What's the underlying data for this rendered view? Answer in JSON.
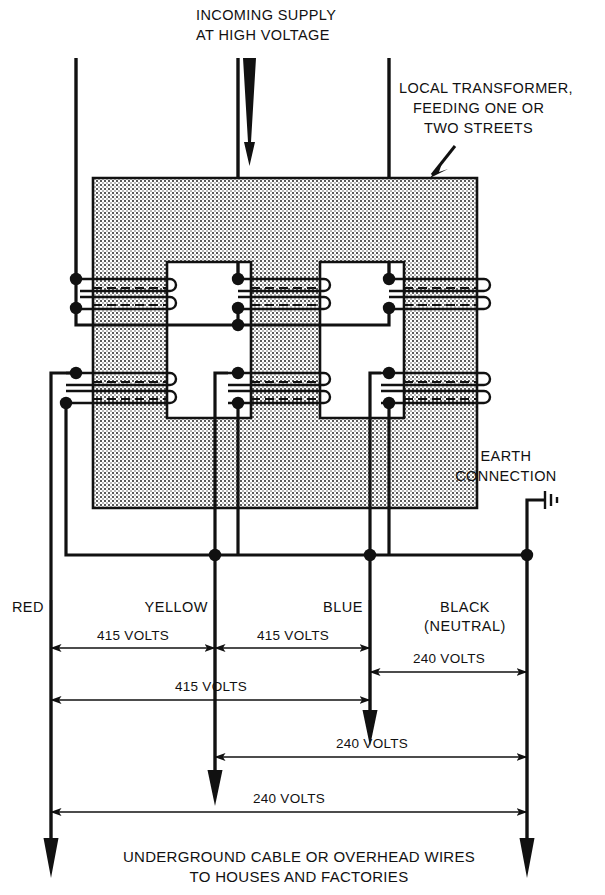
{
  "annotations": {
    "incoming_supply_line1": "INCOMING SUPPLY",
    "incoming_supply_line2": "AT HIGH VOLTAGE",
    "local_transformer_line1": "LOCAL TRANSFORMER,",
    "local_transformer_line2": "FEEDING ONE OR",
    "local_transformer_line3": "TWO STREETS",
    "earth_line1": "EARTH",
    "earth_line2": "CONNECTION",
    "caption_line1": "UNDERGROUND CABLE OR OVERHEAD WIRES",
    "caption_line2": "TO HOUSES AND FACTORIES"
  },
  "conductors": [
    {
      "id": "red",
      "label": "RED",
      "sublabel": "",
      "x": 51
    },
    {
      "id": "yellow",
      "label": "YELLOW",
      "sublabel": "",
      "x": 215
    },
    {
      "id": "blue",
      "label": "BLUE",
      "sublabel": "",
      "x": 370
    },
    {
      "id": "black",
      "label": "BLACK",
      "sublabel": "(NEUTRAL)",
      "x": 527
    }
  ],
  "dimensions": [
    {
      "id": "red-yellow",
      "value": "415 VOLTS",
      "from": "red",
      "to": "yellow",
      "y": 648,
      "label_x": 133,
      "label_y": 640
    },
    {
      "id": "yellow-blue",
      "value": "415 VOLTS",
      "from": "yellow",
      "to": "blue",
      "y": 648,
      "label_x": 293,
      "label_y": 640
    },
    {
      "id": "blue-black",
      "value": "240 VOLTS",
      "from": "blue",
      "to": "black",
      "y": 672,
      "label_x": 449,
      "label_y": 663
    },
    {
      "id": "red-blue",
      "value": "415  VOLTS",
      "from": "red",
      "to": "blue",
      "y": 700,
      "label_x": 211,
      "label_y": 691
    },
    {
      "id": "yellow-black",
      "value": "240  VOLTS",
      "from": "yellow",
      "to": "black",
      "y": 757,
      "label_x": 372,
      "label_y": 748
    },
    {
      "id": "red-black",
      "value": "240 VOLTS",
      "from": "red",
      "to": "black",
      "y": 812,
      "label_x": 289,
      "label_y": 803
    }
  ],
  "hv_supply_lines": [
    76,
    238,
    389
  ],
  "colors": {
    "ink": "#111111",
    "core_fill": "#d8d8d8",
    "background": "#ffffff"
  },
  "icons": {
    "earth_symbol": "earth-ground-icon",
    "supply_arrow": "down-arrow-icon"
  }
}
